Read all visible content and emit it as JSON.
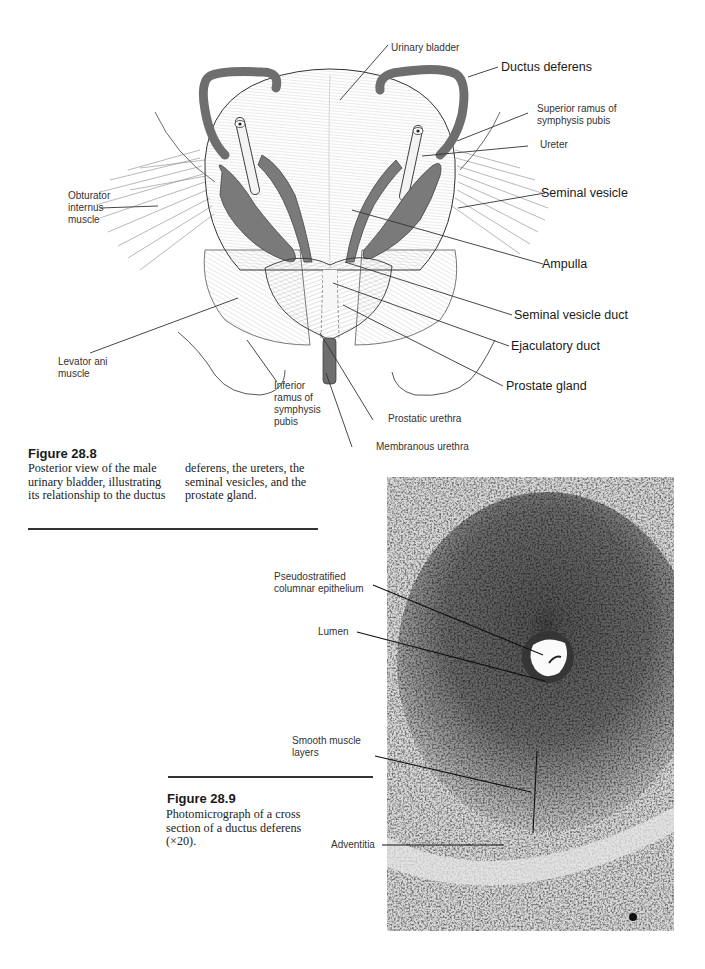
{
  "figure_28_8": {
    "title": "Figure 28.8",
    "caption_col1": "Posterior view of the male urinary bladder, illustrating its relationship to the ductus",
    "caption_col2": "deferens, the ureters, the seminal vesicles, and the prostate gland.",
    "labels": {
      "urinary_bladder": "Urinary bladder",
      "ductus_deferens": "Ductus deferens",
      "superior_ramus": "Superior ramus of symphysis pubis",
      "ureter": "Ureter",
      "seminal_vesicle": "Seminal vesicle",
      "obturator_internus": "Obturator internus muscle",
      "ampulla": "Ampulla",
      "seminal_vesicle_duct": "Seminal vesicle duct",
      "ejaculatory_duct": "Ejaculatory duct",
      "levator_ani": "Levator ani muscle",
      "prostate_gland": "Prostate gland",
      "inferior_ramus": "Inferior ramus of symphysis pubis",
      "prostatic_urethra": "Prostatic urethra",
      "membranous_urethra": "Membranous urethra"
    }
  },
  "figure_28_9": {
    "title": "Figure 28.9",
    "caption": "Photomicrograph of a cross section of a ductus deferens (×20).",
    "labels": {
      "epithelium": "Pseudostratified columnar epithelium",
      "lumen": "Lumen",
      "smooth_muscle": "Smooth muscle layers",
      "adventitia": "Adventitia"
    }
  },
  "colors": {
    "ink": "#222222",
    "shaded_structure": "#7a7a7a",
    "paper": "#ffffff"
  }
}
